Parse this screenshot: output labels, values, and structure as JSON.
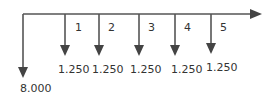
{
  "diagram": {
    "type": "cash-flow-timeline",
    "line_color": "#555555",
    "text_color": "#333333",
    "initial_outflow": {
      "label": "8.000"
    },
    "periods": [
      {
        "period": "1",
        "amount": "1.250"
      },
      {
        "period": "2",
        "amount": "1.250"
      },
      {
        "period": "3",
        "amount": "1.250"
      },
      {
        "period": "4",
        "amount": "1.250"
      },
      {
        "period": "5",
        "amount": "1.250"
      }
    ]
  }
}
